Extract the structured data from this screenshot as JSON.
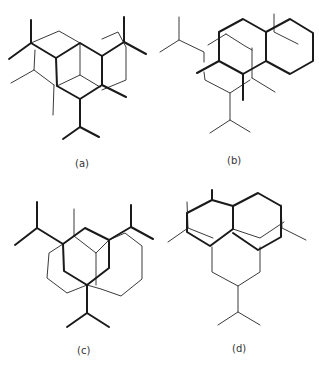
{
  "figure": {
    "panels": [
      {
        "id": "a",
        "label": "(a)"
      },
      {
        "id": "b",
        "label": "(b)"
      },
      {
        "id": "c",
        "label": "(c)"
      },
      {
        "id": "d",
        "label": "(d)"
      }
    ]
  },
  "colors": {
    "line": "#1a1a1a",
    "thin_line": "#3a3a3a",
    "background": "#ffffff"
  }
}
